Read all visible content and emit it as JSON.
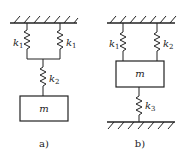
{
  "figure_a": {
    "caption": "a)",
    "springs": [
      {
        "label": "k",
        "sub": "1"
      },
      {
        "label": "k",
        "sub": "1"
      },
      {
        "label": "k",
        "sub": "2"
      }
    ],
    "mass_label": "m"
  },
  "figure_b": {
    "caption": "b)",
    "springs": [
      {
        "label": "k",
        "sub": "1"
      },
      {
        "label": "k",
        "sub": "2"
      },
      {
        "label": "k",
        "sub": "3"
      }
    ],
    "mass_label": "m"
  },
  "colors": {
    "line": "#222222",
    "background": "#ffffff"
  }
}
